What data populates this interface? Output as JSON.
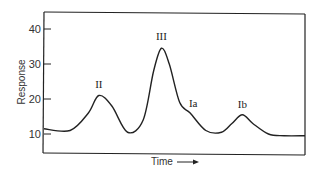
{
  "chart_data": {
    "type": "line",
    "title": "",
    "xlabel": "Time",
    "ylabel": "Response",
    "yticks": [
      10,
      20,
      30,
      40
    ],
    "ylim": [
      5,
      45
    ],
    "grid": false,
    "legend": null,
    "x_units": "relative time (0-100)",
    "series": [
      {
        "name": "Response",
        "x": [
          0,
          10,
          17,
          21,
          26,
          32,
          38,
          42,
          45,
          48,
          52,
          56,
          62,
          68,
          72,
          76,
          80,
          86,
          92,
          100
        ],
        "y": [
          11.5,
          11,
          16,
          21,
          18,
          10.5,
          14,
          28,
          34.5,
          30,
          19,
          16,
          11,
          10.5,
          13,
          15.5,
          13,
          10,
          9.5,
          9.5
        ]
      }
    ],
    "annotations": [
      {
        "text": "II",
        "x": 21,
        "y": 21
      },
      {
        "text": "III",
        "x": 45,
        "y": 34.5
      },
      {
        "text": "Ia",
        "x": 56,
        "y": 16
      },
      {
        "text": "Ib",
        "x": 76,
        "y": 15.5
      }
    ],
    "x_arrow": "→"
  }
}
